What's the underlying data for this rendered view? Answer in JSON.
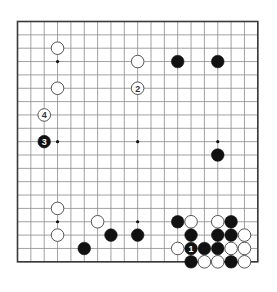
{
  "diagram": {
    "type": "go-board-diagram",
    "board_size": 19,
    "geometry": {
      "origin_x": 17.5,
      "origin_y": 21.5,
      "spacing": 13.35,
      "stone_radius": 6.3,
      "border_color": "#3a3a3a",
      "grid_color": "#8a8a8a",
      "black_color": "#111111",
      "white_fill": "#ffffff",
      "white_stroke": "#555555",
      "background": "#ffffff"
    },
    "star_points": [
      {
        "col": 3,
        "row": 3
      },
      {
        "col": 9,
        "row": 3
      },
      {
        "col": 15,
        "row": 3
      },
      {
        "col": 3,
        "row": 9
      },
      {
        "col": 9,
        "row": 9
      },
      {
        "col": 15,
        "row": 9
      },
      {
        "col": 3,
        "row": 15
      },
      {
        "col": 9,
        "row": 15
      },
      {
        "col": 15,
        "row": 15
      }
    ],
    "stones": [
      {
        "col": 3,
        "row": 2,
        "color": "white",
        "label": ""
      },
      {
        "col": 3,
        "row": 5,
        "color": "white",
        "label": ""
      },
      {
        "col": 9,
        "row": 3,
        "color": "white",
        "label": ""
      },
      {
        "col": 12,
        "row": 3,
        "color": "black",
        "label": ""
      },
      {
        "col": 15,
        "row": 3,
        "color": "black",
        "label": ""
      },
      {
        "col": 9,
        "row": 5,
        "color": "white",
        "label": "2"
      },
      {
        "col": 2,
        "row": 7,
        "color": "white",
        "label": "4"
      },
      {
        "col": 2,
        "row": 9,
        "color": "black",
        "label": "3"
      },
      {
        "col": 15,
        "row": 10,
        "color": "black",
        "label": ""
      },
      {
        "col": 3,
        "row": 14,
        "color": "white",
        "label": ""
      },
      {
        "col": 3,
        "row": 16,
        "color": "white",
        "label": ""
      },
      {
        "col": 6,
        "row": 15,
        "color": "white",
        "label": ""
      },
      {
        "col": 5,
        "row": 17,
        "color": "black",
        "label": ""
      },
      {
        "col": 7,
        "row": 16,
        "color": "black",
        "label": ""
      },
      {
        "col": 9,
        "row": 16,
        "color": "black",
        "label": ""
      },
      {
        "col": 12,
        "row": 15,
        "color": "black",
        "label": ""
      },
      {
        "col": 13,
        "row": 15,
        "color": "white",
        "label": ""
      },
      {
        "col": 15,
        "row": 15,
        "color": "white",
        "label": ""
      },
      {
        "col": 16,
        "row": 15,
        "color": "black",
        "label": ""
      },
      {
        "col": 13,
        "row": 16,
        "color": "black",
        "label": ""
      },
      {
        "col": 15,
        "row": 16,
        "color": "black",
        "label": ""
      },
      {
        "col": 16,
        "row": 16,
        "color": "black",
        "label": ""
      },
      {
        "col": 17,
        "row": 16,
        "color": "white",
        "label": ""
      },
      {
        "col": 12,
        "row": 17,
        "color": "white",
        "label": ""
      },
      {
        "col": 13,
        "row": 17,
        "color": "black",
        "label": "1"
      },
      {
        "col": 14,
        "row": 17,
        "color": "black",
        "label": ""
      },
      {
        "col": 15,
        "row": 17,
        "color": "black",
        "label": ""
      },
      {
        "col": 16,
        "row": 17,
        "color": "white",
        "label": ""
      },
      {
        "col": 17,
        "row": 17,
        "color": "white",
        "label": ""
      },
      {
        "col": 13,
        "row": 18,
        "color": "black",
        "label": ""
      },
      {
        "col": 14,
        "row": 18,
        "color": "white",
        "label": ""
      },
      {
        "col": 15,
        "row": 18,
        "color": "white",
        "label": ""
      },
      {
        "col": 16,
        "row": 18,
        "color": "black",
        "label": ""
      },
      {
        "col": 17,
        "row": 18,
        "color": "white",
        "label": ""
      }
    ],
    "move_labels": [
      {
        "number": "1",
        "color": "black",
        "col": 13,
        "row": 17
      },
      {
        "number": "2",
        "color": "white",
        "col": 9,
        "row": 5
      },
      {
        "number": "3",
        "color": "black",
        "col": 2,
        "row": 9
      },
      {
        "number": "4",
        "color": "white",
        "col": 2,
        "row": 7
      }
    ]
  }
}
